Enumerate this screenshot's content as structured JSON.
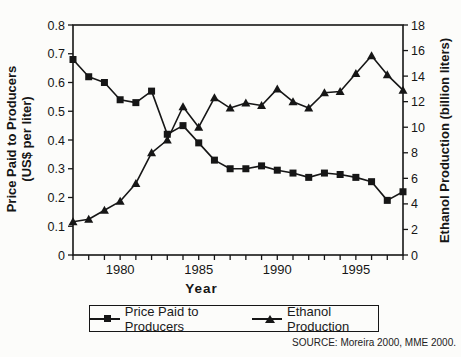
{
  "chart_data": {
    "type": "line",
    "title": "",
    "xlabel": "Year",
    "ylabel_left": "Price Paid to Producers",
    "ylabel_left_sub": "(US$ per liter)",
    "ylabel_right": "Ethanol Production (billion liters)",
    "x_range": [
      1977,
      1998
    ],
    "x_ticks_labeled": [
      1980,
      1985,
      1990,
      1995
    ],
    "y_left": {
      "min": 0,
      "max": 0.8,
      "step": 0.1
    },
    "y_right": {
      "min": 0,
      "max": 18,
      "step": 2
    },
    "grid": false,
    "legend_position": "bottom",
    "x": [
      1977,
      1978,
      1979,
      1980,
      1981,
      1982,
      1983,
      1984,
      1985,
      1986,
      1987,
      1988,
      1989,
      1990,
      1991,
      1992,
      1993,
      1994,
      1995,
      1996,
      1997,
      1998
    ],
    "series": [
      {
        "name": "Price Paid to Producers",
        "axis": "left",
        "marker": "square",
        "color": "#161616",
        "values": [
          0.68,
          0.62,
          0.6,
          0.54,
          0.53,
          0.57,
          0.42,
          0.45,
          0.39,
          0.33,
          0.3,
          0.3,
          0.31,
          0.295,
          0.285,
          0.27,
          0.285,
          0.28,
          0.27,
          0.255,
          0.19,
          0.22
        ]
      },
      {
        "name": "Ethanol Production",
        "axis": "right",
        "marker": "triangle",
        "color": "#161616",
        "values": [
          2.6,
          2.8,
          3.5,
          4.2,
          5.6,
          8.0,
          9.0,
          11.6,
          10.0,
          12.3,
          11.5,
          11.9,
          11.7,
          13.0,
          12.0,
          11.5,
          12.7,
          12.8,
          14.2,
          15.6,
          14.1,
          12.9
        ]
      }
    ]
  },
  "source_note": "SOURCE: Moreira 2000, MME 2000."
}
